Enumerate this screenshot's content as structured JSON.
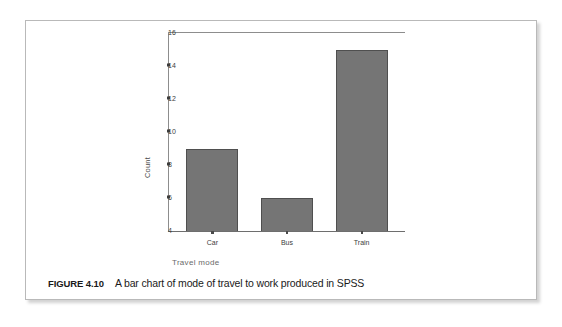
{
  "figure": {
    "caption_number": "FIGURE 4.10",
    "caption_text": "A bar chart of mode of travel to work produced in SPSS"
  },
  "chart_data": {
    "type": "bar",
    "title": "",
    "subtitle": "",
    "categories": [
      "Car",
      "Bus",
      "Train"
    ],
    "values": [
      9,
      6,
      15
    ],
    "series": [
      {
        "name": "Count",
        "values": [
          9,
          6,
          15
        ]
      }
    ],
    "xlabel": "Travel mode",
    "ylabel": "Count",
    "ylim": [
      4,
      16
    ],
    "yticks": [
      16,
      14,
      12,
      10,
      8,
      6,
      4
    ],
    "ytick_labels": [
      "16",
      "14",
      "12",
      "10",
      "8",
      "6",
      "4"
    ],
    "grid": false,
    "legend": false,
    "legend_position": "none",
    "bar_color": "#757575",
    "bar_edge_color": "#4f4f4f",
    "axis_color": "#8d8d8d",
    "annotations": []
  }
}
